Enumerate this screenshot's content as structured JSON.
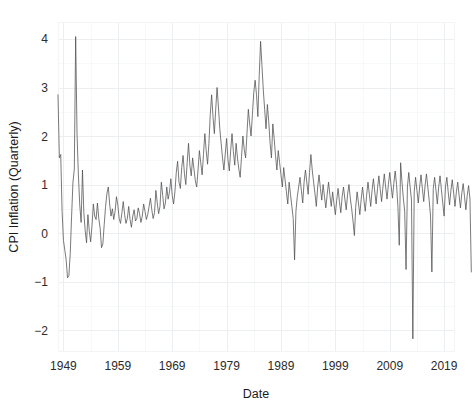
{
  "chart_data": {
    "type": "line",
    "title": "",
    "xlabel": "Date",
    "ylabel": "CPI Inflation (Quarterly)",
    "xlim": [
      1948.0,
      2021.0
    ],
    "ylim": [
      -2.45,
      4.35
    ],
    "x_ticks": [
      1949,
      1959,
      1969,
      1979,
      1989,
      1999,
      2009,
      2019
    ],
    "x_tick_labels": [
      "1949",
      "1959",
      "1969",
      "1979",
      "1989",
      "1999",
      "2009",
      "2019"
    ],
    "y_ticks": [
      -2,
      -1,
      0,
      1,
      2,
      3,
      4
    ],
    "y_tick_labels": [
      "-2",
      "-1",
      "0",
      "1",
      "2",
      "3",
      "4"
    ],
    "grid": true,
    "grid_minor": true,
    "legend": "none",
    "line_color": "#4d4d4d",
    "grid_color": "#eceff1",
    "background_color": "#ffffff",
    "series": [
      {
        "name": "CPI Inflation (Quarterly)",
        "x_start": 1948.0,
        "x_step": 0.25,
        "values": [
          2.85,
          1.55,
          1.62,
          0.45,
          -0.15,
          -0.35,
          -0.55,
          -0.92,
          -0.88,
          -0.42,
          0.35,
          1.05,
          1.32,
          4.05,
          2.05,
          1.2,
          0.58,
          0.22,
          1.3,
          0.42,
          0.05,
          -0.2,
          0.38,
          0.05,
          -0.18,
          0.15,
          0.6,
          0.35,
          0.28,
          0.62,
          0.3,
          0.1,
          -0.3,
          -0.22,
          0.18,
          0.55,
          0.82,
          0.95,
          0.6,
          0.35,
          0.5,
          0.28,
          0.45,
          0.75,
          0.58,
          0.3,
          0.2,
          0.42,
          0.65,
          0.38,
          0.2,
          0.3,
          0.55,
          0.28,
          0.12,
          0.35,
          0.48,
          0.25,
          0.3,
          0.52,
          0.4,
          0.22,
          0.35,
          0.6,
          0.45,
          0.28,
          0.38,
          0.55,
          0.72,
          0.48,
          0.3,
          0.42,
          0.88,
          0.62,
          0.4,
          0.55,
          1.05,
          0.78,
          0.5,
          0.62,
          0.95,
          0.7,
          0.85,
          1.12,
          0.78,
          0.6,
          0.85,
          1.25,
          1.48,
          1.05,
          0.92,
          1.35,
          1.6,
          1.22,
          1.0,
          1.45,
          1.85,
          1.4,
          1.18,
          1.55,
          1.32,
          1.08,
          0.95,
          1.3,
          1.7,
          1.45,
          1.2,
          1.62,
          2.05,
          1.7,
          1.42,
          1.85,
          2.45,
          2.85,
          2.4,
          2.05,
          2.55,
          3.0,
          2.6,
          2.15,
          1.85,
          1.55,
          1.3,
          1.62,
          1.95,
          1.52,
          1.28,
          1.7,
          2.05,
          1.68,
          1.4,
          1.85,
          1.55,
          1.32,
          1.15,
          1.58,
          2.0,
          1.72,
          1.55,
          2.05,
          2.55,
          2.25,
          2.0,
          2.45,
          2.9,
          3.15,
          2.85,
          2.4,
          3.25,
          3.95,
          3.45,
          2.95,
          2.55,
          2.15,
          2.65,
          2.3,
          1.85,
          1.55,
          2.25,
          1.95,
          1.6,
          1.3,
          1.7,
          1.45,
          1.2,
          0.95,
          1.35,
          1.1,
          0.85,
          0.6,
          1.05,
          0.8,
          0.55,
          0.3,
          -0.55,
          0.45,
          0.75,
          0.95,
          1.15,
          0.88,
          0.62,
          1.05,
          1.3,
          1.05,
          0.8,
          1.25,
          1.62,
          1.3,
          1.05,
          0.82,
          0.55,
          0.95,
          1.2,
          0.92,
          0.68,
          1.0,
          0.75,
          0.52,
          0.8,
          1.05,
          0.78,
          0.55,
          0.85,
          0.6,
          0.38,
          0.68,
          0.92,
          0.65,
          0.42,
          0.75,
          0.95,
          0.7,
          0.48,
          0.8,
          1.0,
          0.72,
          0.5,
          0.25,
          -0.05,
          0.55,
          0.85,
          0.62,
          0.38,
          0.7,
          0.95,
          0.68,
          0.45,
          0.78,
          1.05,
          0.8,
          0.55,
          0.88,
          1.12,
          0.85,
          0.6,
          0.92,
          1.18,
          0.9,
          0.65,
          0.95,
          1.22,
          0.95,
          0.7,
          1.0,
          1.25,
          0.98,
          0.72,
          1.02,
          1.28,
          1.0,
          0.55,
          -0.25,
          1.45,
          1.05,
          0.72,
          0.45,
          -0.75,
          0.95,
          1.25,
          0.95,
          0.68,
          -2.18,
          0.85,
          1.15,
          0.88,
          0.62,
          0.95,
          1.2,
          0.92,
          0.65,
          0.98,
          1.22,
          0.95,
          0.68,
          0.35,
          -0.8,
          0.92,
          1.15,
          0.88,
          0.6,
          0.95,
          1.18,
          0.9,
          0.62,
          0.35,
          0.95,
          1.15,
          0.85,
          0.58,
          0.88,
          1.1,
          0.82,
          0.55,
          0.85,
          1.05,
          0.78,
          0.52,
          0.82,
          1.02,
          0.75,
          0.48,
          0.78,
          0.98,
          0.7,
          -0.8
        ]
      }
    ]
  },
  "axis": {
    "y_title": "CPI Inflation (Quarterly)",
    "x_title": "Date"
  }
}
